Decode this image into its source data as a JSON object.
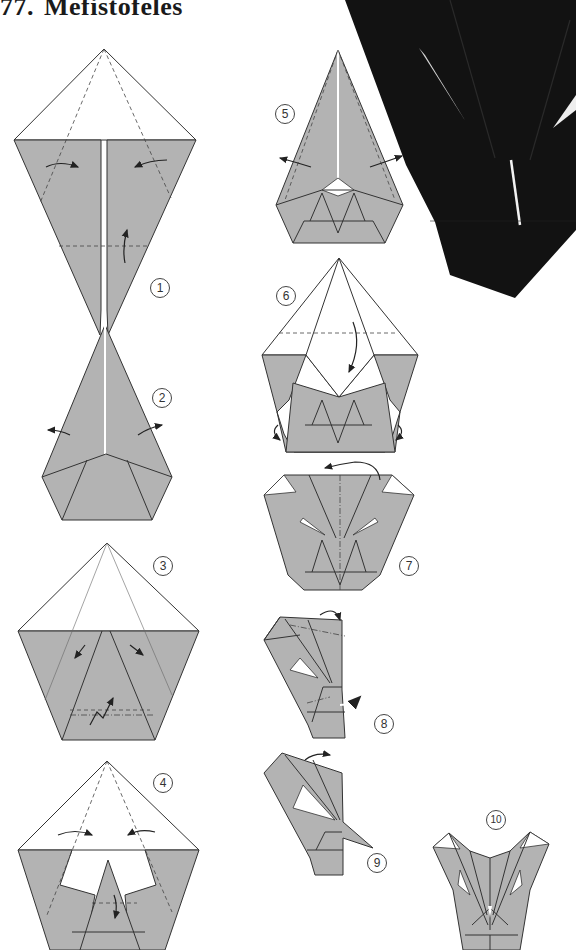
{
  "page": {
    "title_number": "77.",
    "title_text": "Mefistofeles",
    "colors": {
      "paper_gray": "#b3b3b3",
      "paper_white": "#ffffff",
      "line": "#333333",
      "photo_black": "#111111"
    }
  },
  "steps": [
    {
      "id": 1,
      "label": "1"
    },
    {
      "id": 2,
      "label": "2"
    },
    {
      "id": 3,
      "label": "3"
    },
    {
      "id": 4,
      "label": "4"
    },
    {
      "id": 5,
      "label": "5"
    },
    {
      "id": 6,
      "label": "6"
    },
    {
      "id": 7,
      "label": "7"
    },
    {
      "id": 8,
      "label": "8"
    },
    {
      "id": 9,
      "label": "9"
    },
    {
      "id": 10,
      "label": "10"
    }
  ],
  "photo": {
    "subject": "finished-model-photo"
  }
}
